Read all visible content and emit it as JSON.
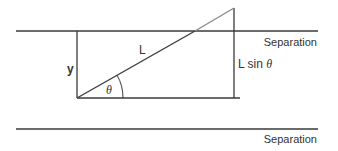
{
  "diagram": {
    "labels": {
      "separation_top": "Separation",
      "separation_bottom": "Separation",
      "y": "y",
      "L": "L",
      "theta": "θ",
      "lsin_prefix": "L sin ",
      "lsin_theta": "θ"
    },
    "colors": {
      "line": "#3a3a3a",
      "hypotenuse_upper": "#8a8a8a",
      "text": "#333333",
      "background": "#ffffff"
    }
  }
}
